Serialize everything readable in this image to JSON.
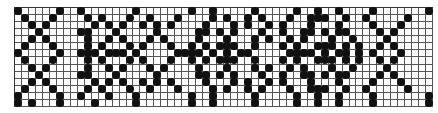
{
  "pattern": {
    "columns": 60,
    "rows": 14,
    "ink_color": "#111111",
    "grid_color": "#555555",
    "description": "Knitting/cross-stitch chart: alternating diagonal X motifs and oval flower motifs",
    "grid": [
      "X.....X..X.......X.......X..X.....X.....X..X..X....X.......X",
      ".X...X....X.X...X..X...X....X.X..X.X...X..XXX..X..X.....X..",
      "..X.X......X.X.X..X.X.X....X...X.X..X.X...X...X....X...X...",
      "...X.....XX...X.....X.....XX.X.X...X..X..XX.X.XX....X.X....",
      "..X.X.....X..X.X...X.X....X...X...X.X..X.X...X..X....X.....",
      ".X...X....X.X...X.X...X..X.X.XXX..X...X.X..XXX.X.X..X.X....",
      "X.....X..XXX.XXX.X.....XXXX.X.X.XX.....XXXX.X.XX.X.X...X...",
      ".X...X....X.X...X.X...X..X.X.XXX..X...X.X..XXX.X.X..X.X....",
      "..X.X.....X..X.X...X.X....X...X...X.X..X.X...X..X....X.....",
      "...X.....XX...X.....X.....XX.X.X...X..X..XX.X.XX....X.X....",
      "..X.X......X.X.X..X.X.X....X...X.X..X.X...X...X....X...X...",
      ".X...X....X.X...X..X...X....X.X..X.X...X..XXX..X..X.....X..",
      "X.....X..X...X...X.......X..X.....X.....X..X..X....X.......X",
      "X.X...X....X.....X.......X..X.....X.....X..X..X....X.......X"
    ]
  }
}
